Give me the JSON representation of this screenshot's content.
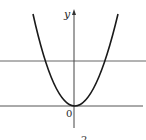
{
  "diagram": {
    "type": "function-graph",
    "axes": {
      "y_label": "y",
      "origin_label": "0"
    },
    "caption_fragment": "2",
    "curves": [
      {
        "name": "parabola",
        "equation_form": "y = ax^2",
        "vertex": [
          0,
          0
        ]
      },
      {
        "name": "horizontal-line",
        "equation_form": "y = c"
      }
    ],
    "colors": {
      "curve": "#1a1a1a",
      "line": "#555555",
      "axis": "#444444"
    }
  }
}
